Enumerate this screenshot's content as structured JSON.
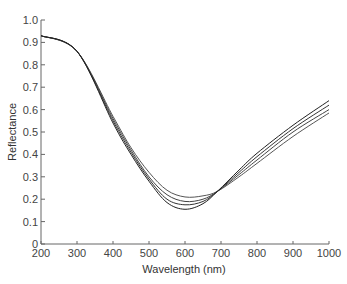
{
  "chart_data": {
    "type": "line",
    "title": "",
    "xlabel": "Wavelength (nm)",
    "ylabel": "Reflectance",
    "xlim": [
      200,
      1000
    ],
    "ylim": [
      0,
      1.0
    ],
    "x_ticks": [
      "200",
      "300",
      "400",
      "500",
      "600",
      "700",
      "800",
      "900",
      "1000"
    ],
    "y_ticks": [
      "0",
      "0.1",
      "0.2",
      "0.3",
      "0.4",
      "0.5",
      "0.6",
      "0.7",
      "0.8",
      "0.9",
      "1.0"
    ],
    "grid": false,
    "legend": null,
    "x": [
      200,
      300,
      400,
      450,
      500,
      550,
      600,
      650,
      690,
      750,
      800,
      900,
      1000
    ],
    "series": [
      {
        "name": "curve 1",
        "color": "#555555",
        "values": [
          0.93,
          0.86,
          0.57,
          0.43,
          0.32,
          0.24,
          0.21,
          0.215,
          0.235,
          0.3,
          0.36,
          0.48,
          0.585
        ]
      },
      {
        "name": "curve 2",
        "color": "#444444",
        "values": [
          0.93,
          0.86,
          0.56,
          0.42,
          0.3,
          0.22,
          0.19,
          0.2,
          0.235,
          0.31,
          0.375,
          0.5,
          0.6
        ]
      },
      {
        "name": "curve 3",
        "color": "#333333",
        "values": [
          0.93,
          0.86,
          0.55,
          0.41,
          0.29,
          0.2,
          0.175,
          0.19,
          0.235,
          0.32,
          0.39,
          0.515,
          0.62
        ]
      },
      {
        "name": "curve 4",
        "color": "#222222",
        "values": [
          0.93,
          0.86,
          0.54,
          0.4,
          0.28,
          0.185,
          0.155,
          0.18,
          0.235,
          0.33,
          0.405,
          0.53,
          0.64
        ]
      }
    ]
  }
}
